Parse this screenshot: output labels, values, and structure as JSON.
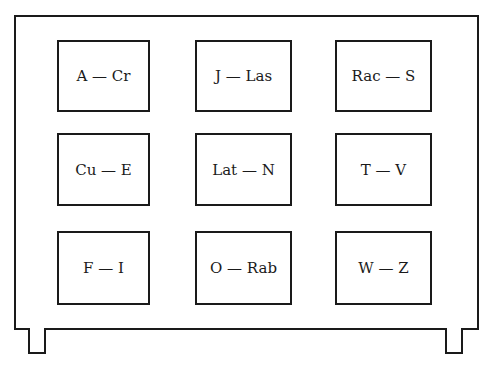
{
  "figure": {
    "type": "card-catalog-cabinet",
    "grid": {
      "rows": 3,
      "columns": 3
    },
    "drawers": [
      {
        "label": "A — Cr"
      },
      {
        "label": "J — Las"
      },
      {
        "label": "Rac — S"
      },
      {
        "label": "Cu — E"
      },
      {
        "label": "Lat — N"
      },
      {
        "label": "T — V"
      },
      {
        "label": "F — I"
      },
      {
        "label": "O — Rab"
      },
      {
        "label": "W — Z"
      }
    ],
    "legs": 2,
    "colors": {
      "line": "#1a1a1a",
      "background": "#ffffff"
    }
  }
}
